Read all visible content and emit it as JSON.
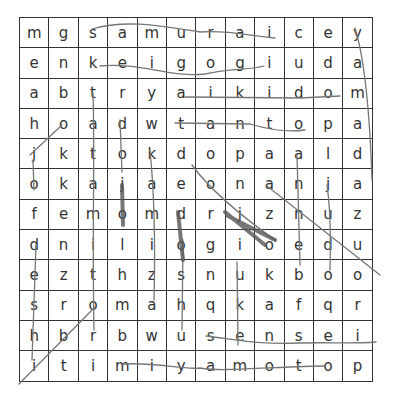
{
  "puzzle": {
    "rows": [
      [
        "m",
        "g",
        "s",
        "a",
        "m",
        "u",
        "r",
        "a",
        "i",
        "c",
        "e",
        "y"
      ],
      [
        "e",
        "n",
        "k",
        "e",
        "i",
        "g",
        "o",
        "g",
        "i",
        "u",
        "d",
        "a"
      ],
      [
        "a",
        "b",
        "t",
        "r",
        "y",
        "a",
        "i",
        "k",
        "i",
        "d",
        "o",
        "m"
      ],
      [
        "h",
        "o",
        "a",
        "d",
        "w",
        "t",
        "a",
        "n",
        "t",
        "o",
        "p",
        "a"
      ],
      [
        "j",
        "k",
        "t",
        "o",
        "k",
        "d",
        "o",
        "p",
        "a",
        "a",
        "l",
        "d"
      ],
      [
        "o",
        "k",
        "a",
        "j",
        "a",
        "e",
        "o",
        "n",
        "a",
        "n",
        "j",
        "a"
      ],
      [
        "f",
        "e",
        "m",
        "o",
        "m",
        "d",
        "r",
        "j",
        "z",
        "n",
        "u",
        "z"
      ],
      [
        "d",
        "n",
        "i",
        "l",
        "i",
        "o",
        "g",
        "i",
        "o",
        "e",
        "d",
        "u"
      ],
      [
        "e",
        "z",
        "t",
        "h",
        "z",
        "s",
        "n",
        "u",
        "k",
        "b",
        "o",
        "o"
      ],
      [
        "s",
        "r",
        "o",
        "m",
        "a",
        "h",
        "q",
        "k",
        "a",
        "f",
        "q",
        "r"
      ],
      [
        "h",
        "b",
        "r",
        "b",
        "w",
        "u",
        "s",
        "e",
        "n",
        "s",
        "e",
        "i"
      ],
      [
        "i",
        "t",
        "i",
        "m",
        "i",
        "y",
        "a",
        "m",
        "o",
        "t",
        "o",
        "p"
      ]
    ]
  }
}
